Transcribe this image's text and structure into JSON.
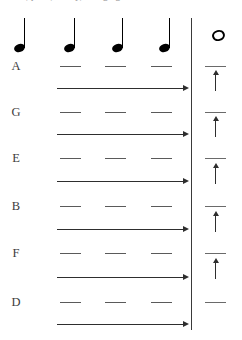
{
  "figure": {
    "width": 242,
    "height": 340,
    "background": "#ffffff",
    "ink_color": "#2e2e2e",
    "dash_color": "#5a5a5a",
    "label_color": "#3c3c3c",
    "cut_caption": "Pitch, pitch, steady, changing"
  },
  "header": {
    "quarter_notes": [
      {
        "name": "quarter-note-1",
        "x": 14,
        "y": 18
      },
      {
        "name": "quarter-note-2",
        "x": 64,
        "y": 18
      },
      {
        "name": "quarter-note-3",
        "x": 112,
        "y": 18
      },
      {
        "name": "quarter-note-4",
        "x": 159,
        "y": 18
      }
    ],
    "whole_note": {
      "name": "whole-note",
      "x": 212,
      "y": 30
    },
    "barline": {
      "x": 191,
      "y": 18,
      "height": 312
    }
  },
  "left_panel": {
    "pitch_labels": [
      {
        "letter": "A",
        "y": 60
      },
      {
        "letter": "G",
        "y": 106
      },
      {
        "letter": "E",
        "y": 152
      },
      {
        "letter": "B",
        "y": 200
      },
      {
        "letter": "F",
        "y": 247
      },
      {
        "letter": "D",
        "y": 296
      }
    ],
    "dash_rows": [
      {
        "y": 66
      },
      {
        "y": 112
      },
      {
        "y": 158
      },
      {
        "y": 206
      },
      {
        "y": 253
      },
      {
        "y": 302
      }
    ],
    "dash_columns": [
      {
        "x": 60,
        "width": 21
      },
      {
        "x": 105,
        "width": 21
      },
      {
        "x": 151,
        "width": 21
      }
    ],
    "arrow_rows": [
      {
        "y": 88
      },
      {
        "y": 134
      },
      {
        "y": 181
      },
      {
        "y": 229
      },
      {
        "y": 277
      },
      {
        "y": 324
      }
    ],
    "arrow_span": {
      "x": 57,
      "width": 126
    }
  },
  "right_panel": {
    "dash_rows": [
      {
        "y": 66
      },
      {
        "y": 112
      },
      {
        "y": 158
      },
      {
        "y": 206
      },
      {
        "y": 253
      },
      {
        "y": 302
      }
    ],
    "dash": {
      "x": 205,
      "width": 21
    },
    "up_arrows": [
      {
        "y": 74
      },
      {
        "y": 120
      },
      {
        "y": 167
      },
      {
        "y": 215
      },
      {
        "y": 262
      }
    ],
    "up_arrow": {
      "x": 215,
      "height": 17
    }
  }
}
